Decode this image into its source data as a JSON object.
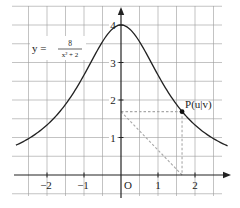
{
  "chart_data": {
    "type": "line",
    "title": "",
    "function_label": {
      "lhs": "y =",
      "numerator": "8",
      "denominator": "x² + 2"
    },
    "formula": "y = 8/(x^2+2)",
    "xlabel": "",
    "ylabel": "",
    "origin_label": "O",
    "xlim": [
      -2.8,
      2.95
    ],
    "ylim": [
      -0.45,
      4.5
    ],
    "x_ticks": [
      {
        "value": -2,
        "label": "−2"
      },
      {
        "value": -1,
        "label": "−1"
      },
      {
        "value": 1,
        "label": "1"
      },
      {
        "value": 2,
        "label": "2"
      }
    ],
    "y_ticks": [
      {
        "value": 1,
        "label": "1"
      },
      {
        "value": 2,
        "label": "2"
      },
      {
        "value": 3,
        "label": "3"
      },
      {
        "value": 4,
        "label": "4"
      }
    ],
    "grid": {
      "on": true,
      "step": 0.5,
      "color": "#9a9a9a"
    },
    "series": [
      {
        "name": "y = 8/(x²+2)",
        "color": "#222222",
        "x": [
          -2.84,
          -2.5,
          -2,
          -1.5,
          -1,
          -0.5,
          0,
          0.5,
          1,
          1.5,
          2,
          2.5,
          2.89
        ],
        "values": [
          0.79,
          0.97,
          1.33,
          1.88,
          2.67,
          3.56,
          4.0,
          3.56,
          2.67,
          1.88,
          1.33,
          0.97,
          0.78
        ]
      }
    ],
    "point": {
      "label": "P(u|v)",
      "u": 1.65,
      "v": 1.69,
      "color": "#111111"
    },
    "construction_lines": {
      "color": "#a8a8a8",
      "style": "dashed",
      "segments": [
        {
          "from": [
            0,
            1.69
          ],
          "to": [
            1.65,
            1.69
          ],
          "name": "horizontal"
        },
        {
          "from": [
            1.65,
            1.69
          ],
          "to": [
            1.65,
            0
          ],
          "name": "vertical"
        },
        {
          "from": [
            0,
            1.69
          ],
          "to": [
            1.65,
            0
          ],
          "name": "diagonal"
        }
      ]
    }
  }
}
